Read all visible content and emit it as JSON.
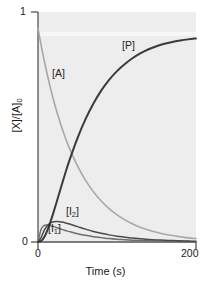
{
  "chart_data": {
    "type": "line",
    "title": "",
    "xlabel": "Time (s)",
    "ylabel": "[X]/[A]0",
    "ylabel_display": "[X]/[A]",
    "ylabel_subscript": "0",
    "xlim": [
      0,
      200
    ],
    "ylim": [
      0,
      1
    ],
    "xticks": [
      0,
      200
    ],
    "xtick_labels": [
      "0",
      "200"
    ],
    "yticks": [
      0,
      1
    ],
    "ytick_labels": [
      "0",
      "1"
    ],
    "grid": false,
    "legend": "inline-annotations",
    "plot_bgcolor": "#ededed",
    "axis_color": "#555555",
    "x": [
      0,
      4,
      8,
      12,
      16,
      20,
      25,
      30,
      35,
      40,
      50,
      60,
      70,
      80,
      90,
      100,
      110,
      120,
      130,
      140,
      150,
      160,
      170,
      180,
      190,
      200
    ],
    "series": [
      {
        "name": "[A]",
        "label": "[A]",
        "color": "#a8a8a8",
        "width": 1.6,
        "values": [
          0.93,
          0.855,
          0.787,
          0.724,
          0.666,
          0.613,
          0.553,
          0.499,
          0.45,
          0.406,
          0.331,
          0.269,
          0.219,
          0.178,
          0.145,
          0.118,
          0.096,
          0.078,
          0.063,
          0.052,
          0.042,
          0.034,
          0.028,
          0.023,
          0.018,
          0.015
        ]
      },
      {
        "name": "[I1]",
        "label": "[I1]",
        "label_base": "[I",
        "label_sub": "1",
        "color": "#6e6e6e",
        "width": 1.5,
        "values": [
          0.0,
          0.055,
          0.072,
          0.074,
          0.071,
          0.067,
          0.061,
          0.055,
          0.05,
          0.045,
          0.036,
          0.029,
          0.023,
          0.019,
          0.015,
          0.012,
          0.01,
          0.008,
          0.006,
          0.005,
          0.004,
          0.003,
          0.003,
          0.002,
          0.002,
          0.001
        ]
      },
      {
        "name": "[I2]",
        "label": "[I2]",
        "label_base": "[I",
        "label_sub": "2",
        "color": "#4a4a4a",
        "width": 1.5,
        "values": [
          0.0,
          0.02,
          0.052,
          0.072,
          0.083,
          0.088,
          0.089,
          0.087,
          0.083,
          0.078,
          0.067,
          0.056,
          0.046,
          0.038,
          0.031,
          0.025,
          0.021,
          0.017,
          0.014,
          0.011,
          0.009,
          0.008,
          0.006,
          0.005,
          0.004,
          0.003
        ]
      },
      {
        "name": "[P]",
        "label": "[P]",
        "color": "#3a3a3a",
        "width": 2.0,
        "values": [
          0.0,
          0.005,
          0.022,
          0.052,
          0.09,
          0.133,
          0.19,
          0.248,
          0.304,
          0.357,
          0.452,
          0.533,
          0.601,
          0.658,
          0.705,
          0.743,
          0.774,
          0.8,
          0.821,
          0.838,
          0.851,
          0.862,
          0.87,
          0.876,
          0.881,
          0.885
        ]
      }
    ],
    "annotations": [
      {
        "text": "[A]",
        "x": 18,
        "y": 0.755
      },
      {
        "text": "[P]",
        "x": 107,
        "y": 0.878
      },
      {
        "text": "[I1]",
        "x": 13,
        "y": 0.092
      },
      {
        "text": "[I2]",
        "x": 36,
        "y": 0.166
      }
    ]
  }
}
